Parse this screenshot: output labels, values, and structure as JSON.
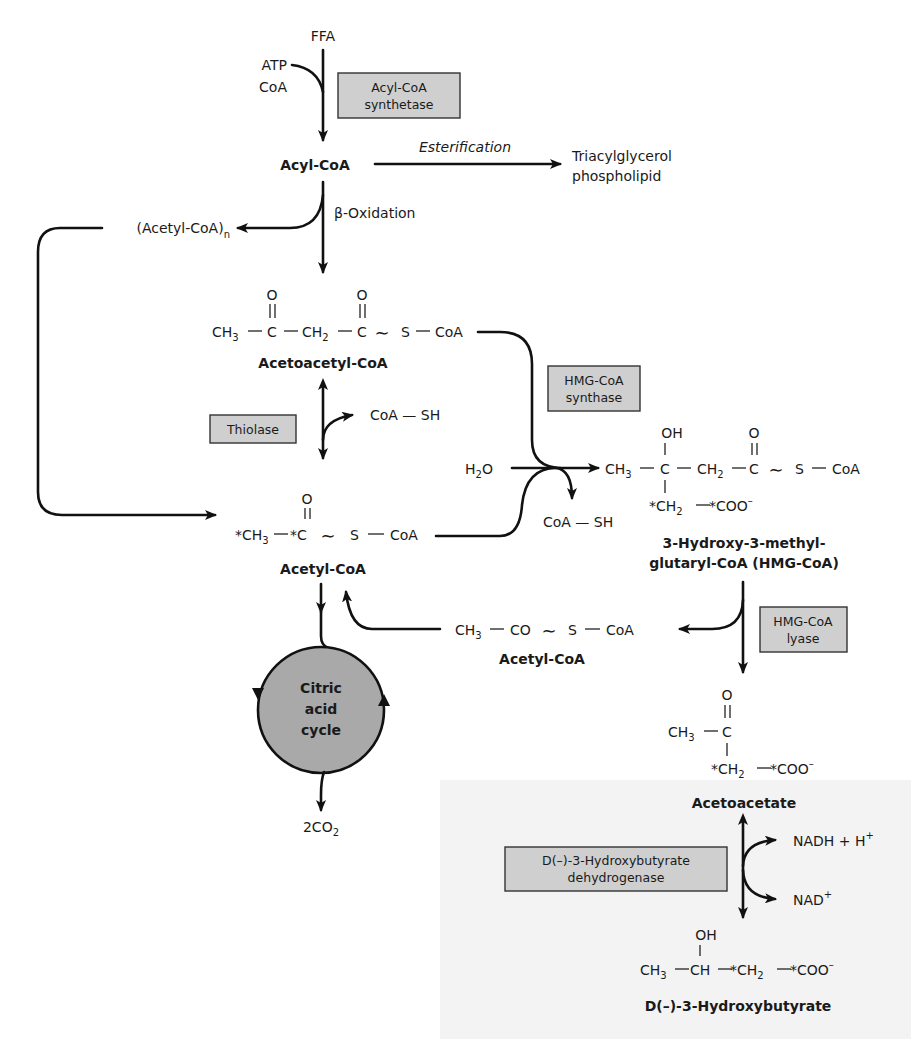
{
  "figure": {
    "type": "metabolic-pathway",
    "colors": {
      "line": "#111111",
      "enzyme_box": "#cfcfcf",
      "cycle_fill": "#a9a9a9",
      "background": "#ffffff"
    }
  },
  "top": {
    "ffa": "FFA",
    "atp": "ATP",
    "coa": "CoA",
    "acyl_coa": "Acyl-CoA",
    "esterification": "Esterification",
    "triacylglycerol": "Triacylglycerol",
    "phospholipid": "phospholipid",
    "beta_oxidation": "β-Oxidation",
    "acetyl_coa_n": "(Acetyl-CoA)",
    "acetyl_coa_n_sub": "n"
  },
  "enzymes": {
    "acyl_coa_synthetase": [
      "Acyl-CoA",
      "synthetase"
    ],
    "thiolase": [
      "Thiolase"
    ],
    "hmg_coa_synthase": [
      "HMG-CoA",
      "synthase"
    ],
    "hmg_coa_lyase": [
      "HMG-CoA",
      "lyase"
    ],
    "hydroxybutyrate_dehydrogenase": [
      "D(–)-3-Hydroxybutyrate",
      "dehydrogenase"
    ]
  },
  "molecules": {
    "acetoacetyl_coa": {
      "name": "Acetoacetyl-CoA",
      "formula": {
        "o1": "O",
        "o2": "O",
        "ch3": "CH",
        "ch3_sub": "3",
        "c1": "C",
        "ch2": "CH",
        "ch2_sub": "2",
        "c2": "C",
        "tilde": "∼",
        "s": "S",
        "coa": "CoA"
      }
    },
    "acetyl_coa_main": {
      "name": "Acetyl-CoA",
      "formula": {
        "o": "O",
        "ch3": "*CH",
        "ch3_sub": "3",
        "c": "*C",
        "tilde": "∼",
        "s": "S",
        "coa": "CoA"
      }
    },
    "hmg_coa": {
      "name_line1": "3-Hydroxy-3-methyl-",
      "name_line2": "glutaryl-CoA (HMG-CoA)",
      "formula": {
        "oh": "OH",
        "o": "O",
        "ch3": "CH",
        "ch3_sub": "3",
        "c1": "C",
        "ch2": "CH",
        "ch2_sub": "2",
        "c2": "C",
        "tilde": "∼",
        "s": "S",
        "coa": "CoA",
        "branch_ch2": "*CH",
        "branch_ch2_sub": "2",
        "coo": "*COO",
        "coo_sup": "–"
      }
    },
    "acetyl_coa_released": {
      "name": "Acetyl-CoA",
      "formula": {
        "ch3": "CH",
        "ch3_sub": "3",
        "co": "CO",
        "tilde": "∼",
        "s": "S",
        "coa": "CoA"
      }
    },
    "acetoacetate": {
      "name": "Acetoacetate",
      "formula": {
        "o": "O",
        "ch3": "CH",
        "ch3_sub": "3",
        "c": "C",
        "ch2": "*CH",
        "ch2_sub": "2",
        "coo": "*COO",
        "coo_sup": "–"
      }
    },
    "hydroxybutyrate": {
      "name": "D(–)-3-Hydroxybutyrate",
      "formula": {
        "oh": "OH",
        "ch3": "CH",
        "ch3_sub": "3",
        "ch": "CH",
        "ch2": "*CH",
        "ch2_sub": "2",
        "coo": "*COO",
        "coo_sup": "–"
      }
    }
  },
  "side_products": {
    "coa_sh_thiolase": "CoA — SH",
    "h2o": "H",
    "h2o_sub": "2",
    "h2o_o": "O",
    "coa_sh_synthase": "CoA — SH",
    "nadh": "NADH + H",
    "nadh_sup": "+",
    "nad": "NAD",
    "nad_sup": "+",
    "co2": "2CO",
    "co2_sub": "2"
  },
  "cycle": {
    "line1": "Citric",
    "line2": "acid",
    "line3": "cycle"
  }
}
